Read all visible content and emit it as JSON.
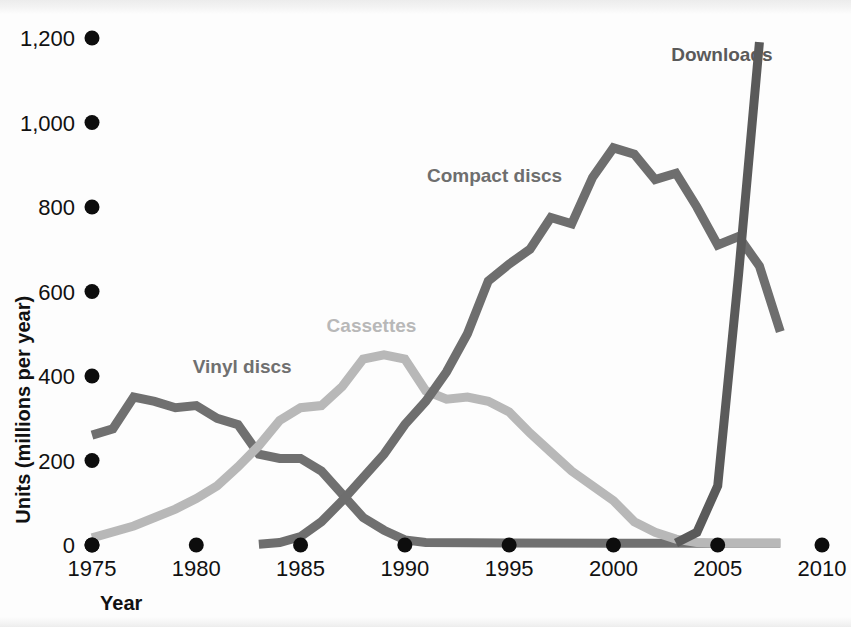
{
  "chart_data": {
    "type": "line",
    "title": "",
    "xlabel": "Year",
    "ylabel": "Units (millions per year)",
    "xlim": [
      1975,
      2010
    ],
    "ylim": [
      0,
      1200
    ],
    "xticks": [
      "1975",
      "1980",
      "1985",
      "1990",
      "1995",
      "2000",
      "2005",
      "2010"
    ],
    "xtick_values": [
      1975,
      1980,
      1985,
      1990,
      1995,
      2000,
      2005,
      2010
    ],
    "yticks": [
      "0",
      "200",
      "400",
      "600",
      "800",
      "1,000",
      "1,200"
    ],
    "ytick_values": [
      0,
      200,
      400,
      600,
      800,
      1000,
      1200
    ],
    "grid": false,
    "legend_position": "inline-labels",
    "tick_marker": "filled-circle",
    "series": [
      {
        "name": "Vinyl discs",
        "color": "#707070",
        "label_x": 1982.2,
        "label_y": 408,
        "label_anchor": "middle",
        "x": [
          1975,
          1976,
          1977,
          1978,
          1979,
          1980,
          1981,
          1982,
          1983,
          1984,
          1985,
          1986,
          1987,
          1988,
          1989,
          1990,
          1991,
          1995,
          2000,
          2004,
          2005,
          2008
        ],
        "y": [
          260,
          275,
          350,
          340,
          325,
          330,
          300,
          285,
          215,
          205,
          205,
          175,
          120,
          65,
          35,
          12,
          6,
          5,
          4,
          4,
          4,
          4
        ]
      },
      {
        "name": "Cassettes",
        "color": "#b8b8b8",
        "label_x": 1988.4,
        "label_y": 505,
        "label_anchor": "middle",
        "x": [
          1975,
          1977,
          1979,
          1980,
          1981,
          1982,
          1983,
          1984,
          1985,
          1986,
          1987,
          1988,
          1989,
          1990,
          1991,
          1992,
          1993,
          1994,
          1995,
          1996,
          1997,
          1998,
          1999,
          2000,
          2001,
          2002,
          2003,
          2004,
          2005,
          2008
        ],
        "y": [
          17,
          45,
          85,
          110,
          140,
          185,
          235,
          295,
          325,
          330,
          375,
          440,
          450,
          440,
          365,
          345,
          350,
          340,
          315,
          265,
          220,
          175,
          140,
          105,
          55,
          30,
          14,
          6,
          4,
          4
        ]
      },
      {
        "name": "Compact discs",
        "color": "#6e6e6e",
        "label_x": 1994.3,
        "label_y": 860,
        "label_anchor": "middle",
        "x": [
          1983,
          1984,
          1985,
          1986,
          1987,
          1988,
          1989,
          1990,
          1991,
          1992,
          1993,
          1994,
          1995,
          1996,
          1997,
          1998,
          1999,
          2000,
          2001,
          2002,
          2003,
          2004,
          2005,
          2006,
          2007,
          2008
        ],
        "y": [
          2,
          6,
          20,
          55,
          105,
          160,
          215,
          285,
          340,
          410,
          500,
          625,
          665,
          700,
          775,
          760,
          870,
          940,
          925,
          865,
          880,
          800,
          710,
          730,
          660,
          505
        ]
      },
      {
        "name": "Downloads",
        "color": "#5a5a5a",
        "label_x": 2005.2,
        "label_y": 1145,
        "label_anchor": "middle",
        "x": [
          2003,
          2004,
          2005,
          2006,
          2007
        ],
        "y": [
          5,
          30,
          140,
          640,
          1190
        ]
      }
    ]
  },
  "geometry": {
    "x_start_px": 92,
    "x_end_px": 822,
    "y_zero_px": 545,
    "y_top_px": 38,
    "y_top_value": 1200,
    "ytick_dot_x": 92,
    "xtick_dot_y": 545,
    "line_width": 9
  }
}
